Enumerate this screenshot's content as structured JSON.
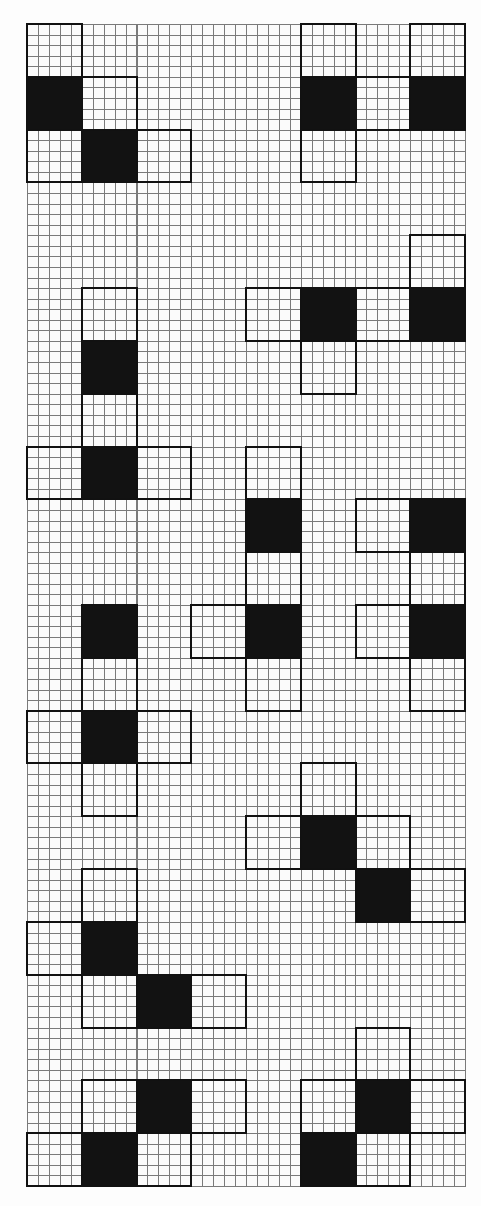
{
  "diagram": {
    "title": "Cube nets on grid paper",
    "grid": {
      "columns": 8,
      "rows": 22,
      "minor_per_major": 5,
      "origin_px": [
        27,
        24
      ],
      "cell_w_px": 54.75,
      "cell_h_px": 52.82,
      "line_color": "#7a7a7a",
      "paper_color": "#fbfbfb"
    },
    "colors": {
      "filled": "#121212",
      "outline": "#111111",
      "empty": "transparent"
    },
    "nets": [
      {
        "id": "net-1",
        "cells": [
          {
            "c": 0,
            "r": 0,
            "fill": "white"
          },
          {
            "c": 0,
            "r": 1,
            "fill": "black"
          },
          {
            "c": 1,
            "r": 1,
            "fill": "white"
          },
          {
            "c": 0,
            "r": 2,
            "fill": "white"
          },
          {
            "c": 1,
            "r": 2,
            "fill": "black"
          },
          {
            "c": 2,
            "r": 2,
            "fill": "white"
          }
        ]
      },
      {
        "id": "net-2",
        "cells": [
          {
            "c": 5,
            "r": 0,
            "fill": "white"
          },
          {
            "c": 7,
            "r": 0,
            "fill": "white"
          },
          {
            "c": 5,
            "r": 1,
            "fill": "black"
          },
          {
            "c": 6,
            "r": 1,
            "fill": "white"
          },
          {
            "c": 7,
            "r": 1,
            "fill": "black"
          },
          {
            "c": 5,
            "r": 2,
            "fill": "white"
          }
        ]
      },
      {
        "id": "net-3",
        "cells": [
          {
            "c": 7,
            "r": 4,
            "fill": "white"
          },
          {
            "c": 4,
            "r": 5,
            "fill": "white"
          },
          {
            "c": 5,
            "r": 5,
            "fill": "black"
          },
          {
            "c": 6,
            "r": 5,
            "fill": "white"
          },
          {
            "c": 7,
            "r": 5,
            "fill": "black"
          },
          {
            "c": 5,
            "r": 6,
            "fill": "white"
          }
        ]
      },
      {
        "id": "net-4",
        "cells": [
          {
            "c": 1,
            "r": 5,
            "fill": "white"
          },
          {
            "c": 1,
            "r": 6,
            "fill": "black"
          },
          {
            "c": 1,
            "r": 7,
            "fill": "white"
          },
          {
            "c": 0,
            "r": 8,
            "fill": "white"
          },
          {
            "c": 1,
            "r": 8,
            "fill": "black"
          },
          {
            "c": 2,
            "r": 8,
            "fill": "white"
          }
        ]
      },
      {
        "id": "net-5",
        "cells": [
          {
            "c": 4,
            "r": 8,
            "fill": "white"
          },
          {
            "c": 4,
            "r": 9,
            "fill": "black"
          },
          {
            "c": 4,
            "r": 10,
            "fill": "white"
          },
          {
            "c": 3,
            "r": 11,
            "fill": "white"
          },
          {
            "c": 4,
            "r": 11,
            "fill": "black"
          },
          {
            "c": 4,
            "r": 12,
            "fill": "white"
          }
        ]
      },
      {
        "id": "net-6",
        "cells": [
          {
            "c": 6,
            "r": 9,
            "fill": "white"
          },
          {
            "c": 7,
            "r": 9,
            "fill": "black"
          },
          {
            "c": 7,
            "r": 10,
            "fill": "white"
          },
          {
            "c": 6,
            "r": 11,
            "fill": "white"
          },
          {
            "c": 7,
            "r": 11,
            "fill": "black"
          },
          {
            "c": 7,
            "r": 12,
            "fill": "white"
          }
        ]
      },
      {
        "id": "net-7",
        "cells": [
          {
            "c": 1,
            "r": 11,
            "fill": "black"
          },
          {
            "c": 1,
            "r": 12,
            "fill": "white"
          },
          {
            "c": 0,
            "r": 13,
            "fill": "white"
          },
          {
            "c": 1,
            "r": 13,
            "fill": "black"
          },
          {
            "c": 2,
            "r": 13,
            "fill": "white"
          },
          {
            "c": 1,
            "r": 14,
            "fill": "white"
          }
        ]
      },
      {
        "id": "net-8",
        "cells": [
          {
            "c": 5,
            "r": 14,
            "fill": "white"
          },
          {
            "c": 4,
            "r": 15,
            "fill": "white"
          },
          {
            "c": 5,
            "r": 15,
            "fill": "black"
          },
          {
            "c": 6,
            "r": 15,
            "fill": "white"
          },
          {
            "c": 6,
            "r": 16,
            "fill": "black"
          },
          {
            "c": 7,
            "r": 16,
            "fill": "white"
          }
        ]
      },
      {
        "id": "net-9",
        "cells": [
          {
            "c": 1,
            "r": 16,
            "fill": "white"
          },
          {
            "c": 0,
            "r": 17,
            "fill": "white"
          },
          {
            "c": 1,
            "r": 17,
            "fill": "black"
          },
          {
            "c": 1,
            "r": 18,
            "fill": "white"
          },
          {
            "c": 2,
            "r": 18,
            "fill": "black"
          },
          {
            "c": 3,
            "r": 18,
            "fill": "white"
          }
        ]
      },
      {
        "id": "net-10",
        "cells": [
          {
            "c": 1,
            "r": 20,
            "fill": "white"
          },
          {
            "c": 2,
            "r": 20,
            "fill": "black"
          },
          {
            "c": 3,
            "r": 20,
            "fill": "white"
          },
          {
            "c": 0,
            "r": 21,
            "fill": "white"
          },
          {
            "c": 1,
            "r": 21,
            "fill": "black"
          },
          {
            "c": 2,
            "r": 21,
            "fill": "white"
          }
        ]
      },
      {
        "id": "net-11",
        "cells": [
          {
            "c": 6,
            "r": 19,
            "fill": "white"
          },
          {
            "c": 5,
            "r": 20,
            "fill": "white"
          },
          {
            "c": 6,
            "r": 20,
            "fill": "black"
          },
          {
            "c": 7,
            "r": 20,
            "fill": "white"
          },
          {
            "c": 5,
            "r": 21,
            "fill": "black"
          },
          {
            "c": 6,
            "r": 21,
            "fill": "white"
          }
        ]
      }
    ]
  }
}
